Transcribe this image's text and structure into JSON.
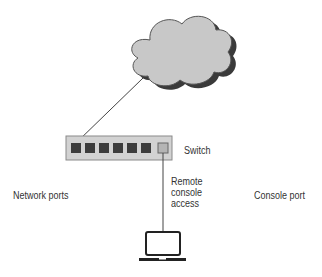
{
  "diagram": {
    "type": "network-topology",
    "nodes": [
      {
        "id": "cloud",
        "label": ""
      },
      {
        "id": "switch",
        "label": "Switch",
        "network_port_count": 6,
        "console_port_count": 1
      },
      {
        "id": "laptop",
        "label": ""
      }
    ],
    "edges": [
      {
        "from": "cloud",
        "to": "switch.network_port_1"
      },
      {
        "from": "switch.console_port",
        "to": "laptop",
        "label": "Remote console access"
      }
    ]
  },
  "labels": {
    "switch": "Switch",
    "network_ports": "Network ports",
    "remote_console_line1": "Remote",
    "remote_console_line2": "console",
    "remote_console_line3": "access",
    "console_port": "Console port"
  },
  "colors": {
    "cloud_fill": "#c8c8c8",
    "cloud_shadow": "#3a3a3a",
    "switch_fill": "#d2d2d2",
    "switch_border": "#8a8a8a",
    "network_port": "#3c3c3c",
    "console_port": "#b4b4b4",
    "line": "#444444",
    "laptop": "#222222"
  }
}
